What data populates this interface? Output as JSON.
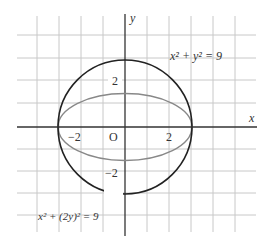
{
  "figure": {
    "axis_labels": {
      "x": "x",
      "y": "y"
    },
    "origin_label": "O",
    "tick_labels": {
      "x_neg": "−2",
      "x_pos": "2",
      "y_pos": "2",
      "y_neg": "−2"
    },
    "equations": {
      "circle": "x² + y² = 9",
      "ellipse": "x² + (2y)² = 9"
    },
    "colors": {
      "grid": "#c8c8c8",
      "axes": "#333333",
      "circle": "#222222",
      "ellipse": "#888888"
    }
  }
}
